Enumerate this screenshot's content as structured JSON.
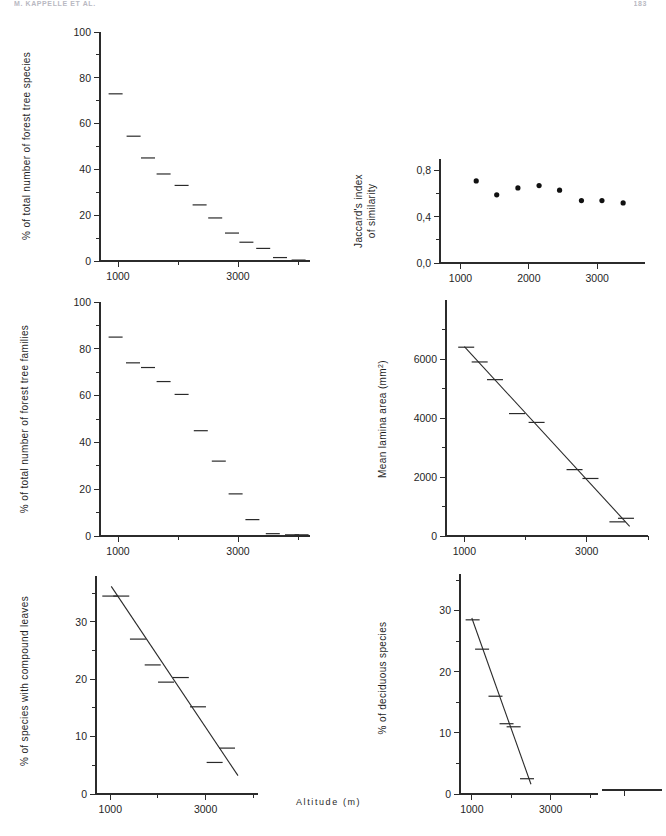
{
  "running_head": {
    "title": "M. KAPPELLE ET AL.",
    "page": "183"
  },
  "figure": {
    "x_axis_caption": "Altitude (m)",
    "shared_x": {
      "label": "Altitude (m)",
      "ticks": [
        1000,
        2000,
        3000,
        4000
      ],
      "tick_labels": [
        "1000",
        "",
        "3000",
        ""
      ],
      "min": 700,
      "max": 4200
    }
  },
  "chart_data": [
    {
      "id": "species-percent",
      "type": "bar",
      "title": "",
      "xlabel": "Altitude (m)",
      "ylabel": "% of total number of forest tree species",
      "xlim": [
        700,
        4200
      ],
      "ylim": [
        0,
        100
      ],
      "xticks": [
        1000,
        2000,
        3000,
        4000
      ],
      "xticklabels": [
        "1000",
        "",
        "3000",
        ""
      ],
      "yticks": [
        0,
        10,
        20,
        30,
        40,
        50,
        60,
        70,
        80,
        90,
        100
      ],
      "yticklabels": [
        "0",
        "",
        "20",
        "",
        "40",
        "",
        "60",
        "",
        "80",
        "",
        "100"
      ],
      "grid": false,
      "marker": "horizontal-dash",
      "x": [
        960,
        1260,
        1500,
        1760,
        2060,
        2360,
        2620,
        2900,
        3140,
        3420,
        3700,
        4010
      ],
      "values": [
        73,
        54.5,
        45,
        38,
        33,
        24.5,
        18.8,
        12.2,
        8.2,
        5.5,
        1.5,
        0.4
      ]
    },
    {
      "id": "jaccard-index",
      "type": "scatter",
      "title": "",
      "xlabel": "Altitude (m)",
      "ylabel": "Jaccard's index of similarity",
      "ylabel_lines": [
        "Jaccard's index",
        "of similarity"
      ],
      "xlim": [
        700,
        3700
      ],
      "ylim": [
        0.0,
        0.9
      ],
      "xticks": [
        1000,
        2000,
        3000
      ],
      "xticklabels": [
        "1000",
        "2000",
        "3000"
      ],
      "yticks": [
        0.0,
        0.2,
        0.4,
        0.6,
        0.8
      ],
      "yticklabels": [
        "0,0",
        "",
        "0,4",
        "",
        "0,8"
      ],
      "grid": false,
      "marker": "filled-circle",
      "x": [
        1230,
        1530,
        1840,
        2150,
        2450,
        2770,
        3070,
        3380
      ],
      "values": [
        0.71,
        0.59,
        0.65,
        0.67,
        0.63,
        0.54,
        0.54,
        0.52
      ]
    },
    {
      "id": "families-percent",
      "type": "bar",
      "title": "",
      "xlabel": "Altitude (m)",
      "ylabel": "% of total number of forest tree families",
      "xlim": [
        700,
        4200
      ],
      "ylim": [
        0,
        100
      ],
      "xticks": [
        1000,
        2000,
        3000,
        4000
      ],
      "xticklabels": [
        "1000",
        "",
        "3000",
        ""
      ],
      "yticks": [
        0,
        10,
        20,
        30,
        40,
        50,
        60,
        70,
        80,
        90,
        100
      ],
      "yticklabels": [
        "0",
        "",
        "20",
        "",
        "40",
        "",
        "60",
        "",
        "80",
        "",
        "100"
      ],
      "grid": false,
      "marker": "horizontal-dash",
      "x": [
        960,
        1250,
        1500,
        1760,
        2060,
        2380,
        2680,
        2960,
        3240,
        3580,
        3900,
        4060
      ],
      "values": [
        85,
        74,
        72,
        66,
        60.5,
        45,
        32,
        18,
        7,
        1,
        0.5,
        0.5
      ]
    },
    {
      "id": "mean-lamina-area",
      "type": "scatter",
      "title": "",
      "xlabel": "Altitude (m)",
      "ylabel": "Mean lamina area (mm2)",
      "ylabel_base": "Mean lamina area (mm",
      "ylabel_sup": "2",
      "ylabel_tail": ")",
      "xlim": [
        700,
        4000
      ],
      "ylim": [
        0,
        8000
      ],
      "xticks": [
        1000,
        2000,
        3000,
        4000
      ],
      "xticklabels": [
        "1000",
        "",
        "3000",
        ""
      ],
      "yticks": [
        0,
        1000,
        2000,
        3000,
        4000,
        5000,
        6000,
        7000
      ],
      "yticklabels": [
        "0",
        "",
        "2000",
        "",
        "4000",
        "",
        "6000",
        ""
      ],
      "grid": false,
      "marker": "horizontal-dash",
      "trendline": {
        "x1": 1000,
        "y1": 6420,
        "x2": 3700,
        "y2": 330
      },
      "x": [
        1030,
        1250,
        1500,
        1860,
        2180,
        2800,
        3060,
        3500,
        3640
      ],
      "values": [
        6400,
        5900,
        5300,
        4150,
        3850,
        2250,
        1950,
        480,
        600
      ]
    },
    {
      "id": "compound-leaves",
      "type": "scatter",
      "title": "",
      "xlabel": "Altitude (m)",
      "ylabel": "% of species with compound leaves",
      "xlim": [
        700,
        4100
      ],
      "ylim": [
        0,
        38
      ],
      "xticks": [
        1000,
        2000,
        3000,
        4000
      ],
      "xticklabels": [
        "1000",
        "",
        "3000",
        ""
      ],
      "yticks": [
        0,
        5,
        10,
        15,
        20,
        25,
        30,
        35
      ],
      "yticklabels": [
        "0",
        "",
        "10",
        "",
        "20",
        "",
        "30",
        ""
      ],
      "grid": false,
      "marker": "horizontal-dash",
      "trendline": {
        "x1": 1020,
        "y1": 36.2,
        "x2": 3680,
        "y2": 3.2
      },
      "x": [
        1000,
        1230,
        1580,
        1890,
        2170,
        2480,
        2840,
        3190,
        3450
      ],
      "values": [
        34.5,
        34.5,
        27,
        22.5,
        19.5,
        20.3,
        15.2,
        5.5,
        8
      ]
    },
    {
      "id": "deciduous-species",
      "type": "scatter",
      "title": "",
      "xlabel": "Altitude (m)",
      "ylabel": "% of deciduous species",
      "xlim": [
        700,
        4200
      ],
      "ylim": [
        0,
        36
      ],
      "xticks": [
        1000,
        2000,
        3000,
        4000
      ],
      "xticklabels": [
        "1000",
        "",
        "3000",
        ""
      ],
      "yticks": [
        0,
        5,
        10,
        15,
        20,
        25,
        30,
        35
      ],
      "yticklabels": [
        "0",
        "",
        "10",
        "",
        "20",
        "",
        "30",
        ""
      ],
      "grid": false,
      "marker": "horizontal-dash",
      "trendline": {
        "x1": 1000,
        "y1": 28.8,
        "x2": 2500,
        "y2": 1.6
      },
      "x": [
        1020,
        1260,
        1600,
        1880,
        2060,
        2400
      ],
      "values": [
        28.5,
        23.7,
        16,
        11.5,
        11,
        2.5
      ]
    }
  ]
}
